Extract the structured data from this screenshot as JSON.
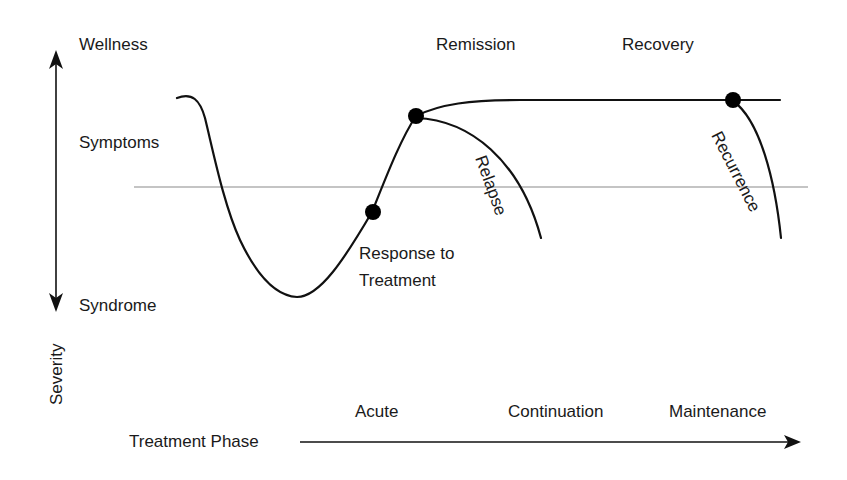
{
  "severity_axis": {
    "label": "Severity",
    "top_label": "Wellness",
    "middle_label": "Symptoms",
    "bottom_label": "Syndrome"
  },
  "outcomes": {
    "remission": "Remission",
    "recovery": "Recovery",
    "relapse": "Relapse",
    "recurrence": "Recurrence",
    "response_line1": "Response to",
    "response_line2": "Treatment"
  },
  "treatment_phase_axis": {
    "label": "Treatment Phase",
    "phases": [
      "Acute",
      "Continuation",
      "Maintenance"
    ]
  },
  "colors": {
    "curve": "#111111",
    "threshold": "#8a8a8a",
    "background": "#ffffff"
  }
}
